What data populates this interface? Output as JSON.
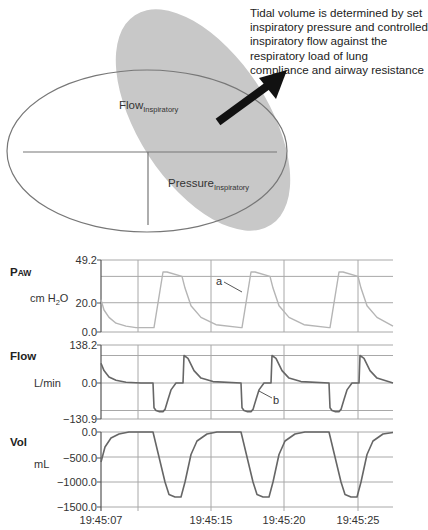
{
  "diagram": {
    "annotation_text": "Tidal volume is determined by set inspiratory pressure and controlled inspiratory flow against the respiratory load of lung compliance and airway resistance",
    "flow_label": {
      "main": "Flow",
      "sub": "Inspiratory"
    },
    "pressure_label": {
      "main": "Pressure",
      "sub": "Inspiratory"
    },
    "colors": {
      "shaded_ellipse": "#c8c8c8",
      "outline": "#707070",
      "arrow": "#111111"
    }
  },
  "chart_data": {
    "type": "line",
    "title": "",
    "xlabel": "",
    "x_ticks": [
      "19:45:07",
      "19:45:15",
      "19:45:20",
      "19:45:25"
    ],
    "grid": true,
    "line_color_paw": "#b5b5b5",
    "line_color_flow_vol": "#666666",
    "panels": [
      {
        "id": "paw",
        "label": "P",
        "label_sub": "AW",
        "unit": "cm H",
        "unit_sub": "2",
        "unit_tail": "O",
        "ylim": [
          0.0,
          49.2
        ],
        "ticks": [
          "49.2",
          "20.0",
          "0.0"
        ],
        "annotation": "a",
        "series": {
          "name": "Airway pressure",
          "x": [
            0,
            3,
            8,
            15,
            25,
            35,
            52,
            53,
            62,
            66,
            81,
            84,
            90,
            100,
            115,
            140,
            141,
            150,
            154,
            169,
            172,
            178,
            188,
            203,
            228,
            229,
            238,
            242,
            257,
            260,
            266,
            276,
            292
          ],
          "y": [
            22,
            15,
            10,
            6,
            4,
            3,
            3,
            3,
            41,
            41,
            38,
            30,
            18,
            10,
            5,
            3,
            3,
            41,
            41,
            38,
            30,
            18,
            10,
            5,
            3,
            3,
            41,
            41,
            38,
            30,
            18,
            10,
            4
          ]
        }
      },
      {
        "id": "flow",
        "label": "Flow",
        "unit": "L/min",
        "ylim": [
          -130.9,
          138.2
        ],
        "ticks": [
          "138.2",
          "0.0",
          "-130.9"
        ],
        "annotation": "b",
        "series": {
          "name": "Flow",
          "x": [
            0,
            3,
            8,
            15,
            25,
            40,
            52,
            53,
            55,
            58,
            62,
            64,
            67,
            70,
            75,
            82,
            83,
            87,
            93,
            100,
            112,
            140,
            141,
            143,
            146,
            150,
            152,
            155,
            158,
            163,
            170,
            171,
            175,
            181,
            188,
            200,
            228,
            229,
            231,
            234,
            238,
            240,
            243,
            246,
            251,
            258,
            259,
            263,
            269,
            276,
            292
          ],
          "y": [
            72,
            45,
            22,
            10,
            3,
            0,
            0,
            -90,
            -100,
            -104,
            -104,
            -96,
            -60,
            -25,
            0,
            0,
            100,
            90,
            45,
            18,
            5,
            0,
            -90,
            -100,
            -104,
            -104,
            -96,
            -60,
            -25,
            0,
            0,
            100,
            90,
            45,
            18,
            5,
            0,
            -90,
            -100,
            -104,
            -104,
            -96,
            -60,
            -25,
            0,
            0,
            100,
            90,
            45,
            18,
            0
          ]
        }
      },
      {
        "id": "vol",
        "label": "Vol",
        "unit": "mL",
        "ylim": [
          -1500.0,
          0.0
        ],
        "ticks": [
          "0.0",
          "-500.0",
          "-1000.0",
          "-1500.0"
        ],
        "series": {
          "name": "Volume",
          "x": [
            0,
            4,
            10,
            18,
            28,
            52,
            58,
            64,
            68,
            74,
            80,
            84,
            90,
            96,
            106,
            116,
            140,
            146,
            152,
            156,
            162,
            168,
            172,
            178,
            184,
            194,
            204,
            228,
            234,
            240,
            244,
            250,
            256,
            260,
            266,
            272,
            282,
            292
          ],
          "y": [
            -600,
            -300,
            -120,
            -40,
            0,
            0,
            -500,
            -1000,
            -1250,
            -1300,
            -1300,
            -1000,
            -450,
            -180,
            -40,
            0,
            0,
            -500,
            -1000,
            -1250,
            -1300,
            -1300,
            -1000,
            -450,
            -180,
            -40,
            0,
            0,
            -500,
            -1000,
            -1250,
            -1300,
            -1300,
            -1000,
            -450,
            -180,
            -40,
            -10
          ]
        }
      }
    ]
  }
}
